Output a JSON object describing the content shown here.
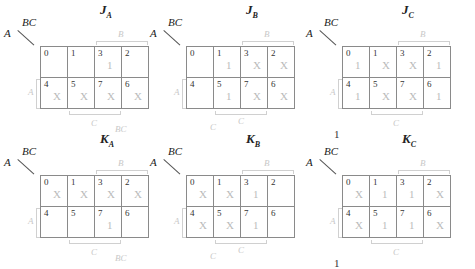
{
  "maps": [
    {
      "id": "JA",
      "letter": "J",
      "sub": "A",
      "row_var": "A",
      "col_var": "BC",
      "cells": [
        {
          "i": "0",
          "v": ""
        },
        {
          "i": "1",
          "v": ""
        },
        {
          "i": "3",
          "v": "1"
        },
        {
          "i": "2",
          "v": ""
        },
        {
          "i": "4",
          "v": "X"
        },
        {
          "i": "5",
          "v": "X"
        },
        {
          "i": "7",
          "v": "X"
        },
        {
          "i": "6",
          "v": "X"
        }
      ],
      "top_label": "B",
      "left_label": "A",
      "bottom_labels": [
        "C",
        "BC"
      ],
      "note": ""
    },
    {
      "id": "JB",
      "letter": "J",
      "sub": "B",
      "row_var": "A",
      "col_var": "BC",
      "cells": [
        {
          "i": "0",
          "v": ""
        },
        {
          "i": "1",
          "v": "1"
        },
        {
          "i": "3",
          "v": "X"
        },
        {
          "i": "2",
          "v": "X"
        },
        {
          "i": "4",
          "v": ""
        },
        {
          "i": "5",
          "v": "1"
        },
        {
          "i": "7",
          "v": "X"
        },
        {
          "i": "6",
          "v": "X"
        }
      ],
      "top_label": "B",
      "left_label": "A",
      "bottom_labels": [
        "C",
        "C"
      ],
      "note": ""
    },
    {
      "id": "JC",
      "letter": "J",
      "sub": "C",
      "row_var": "A",
      "col_var": "BC",
      "cells": [
        {
          "i": "0",
          "v": "1"
        },
        {
          "i": "1",
          "v": "X"
        },
        {
          "i": "3",
          "v": "X"
        },
        {
          "i": "2",
          "v": "1"
        },
        {
          "i": "4",
          "v": "1"
        },
        {
          "i": "5",
          "v": "X"
        },
        {
          "i": "7",
          "v": "X"
        },
        {
          "i": "6",
          "v": "1"
        }
      ],
      "top_label": "B",
      "left_label": "A",
      "bottom_labels": [
        "C"
      ],
      "note": "1"
    },
    {
      "id": "KA",
      "letter": "K",
      "sub": "A",
      "row_var": "A",
      "col_var": "BC",
      "cells": [
        {
          "i": "0",
          "v": "X"
        },
        {
          "i": "1",
          "v": "X"
        },
        {
          "i": "3",
          "v": "X"
        },
        {
          "i": "2",
          "v": "X"
        },
        {
          "i": "4",
          "v": ""
        },
        {
          "i": "5",
          "v": ""
        },
        {
          "i": "7",
          "v": "1"
        },
        {
          "i": "6",
          "v": ""
        }
      ],
      "top_label": "B",
      "left_label": "A",
      "bottom_labels": [
        "C",
        "BC"
      ],
      "note": ""
    },
    {
      "id": "KB",
      "letter": "K",
      "sub": "B",
      "row_var": "A",
      "col_var": "BC",
      "cells": [
        {
          "i": "0",
          "v": "X"
        },
        {
          "i": "1",
          "v": "X"
        },
        {
          "i": "3",
          "v": "1"
        },
        {
          "i": "2",
          "v": ""
        },
        {
          "i": "4",
          "v": "X"
        },
        {
          "i": "5",
          "v": "X"
        },
        {
          "i": "7",
          "v": "1"
        },
        {
          "i": "6",
          "v": ""
        }
      ],
      "top_label": "B",
      "left_label": "A",
      "bottom_labels": [
        "C",
        "C"
      ],
      "note": ""
    },
    {
      "id": "KC",
      "letter": "K",
      "sub": "C",
      "row_var": "A",
      "col_var": "BC",
      "cells": [
        {
          "i": "0",
          "v": "X"
        },
        {
          "i": "1",
          "v": "1"
        },
        {
          "i": "3",
          "v": "1"
        },
        {
          "i": "2",
          "v": "X"
        },
        {
          "i": "4",
          "v": "X"
        },
        {
          "i": "5",
          "v": "1"
        },
        {
          "i": "7",
          "v": "1"
        },
        {
          "i": "6",
          "v": "X"
        }
      ],
      "top_label": "B",
      "left_label": "A",
      "bottom_labels": [
        "C"
      ],
      "note": "1"
    }
  ]
}
